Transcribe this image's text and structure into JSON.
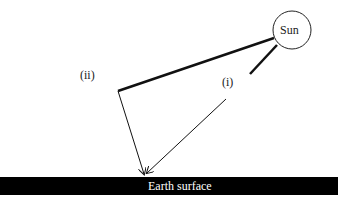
{
  "diagram": {
    "sun_label": "Sun",
    "path_i_label": "(i)",
    "path_ii_label": "(ii)",
    "earth_label": "Earth surface",
    "colors": {
      "line": "#111111",
      "earth": "#000000",
      "earth_text": "#ffffff"
    }
  }
}
